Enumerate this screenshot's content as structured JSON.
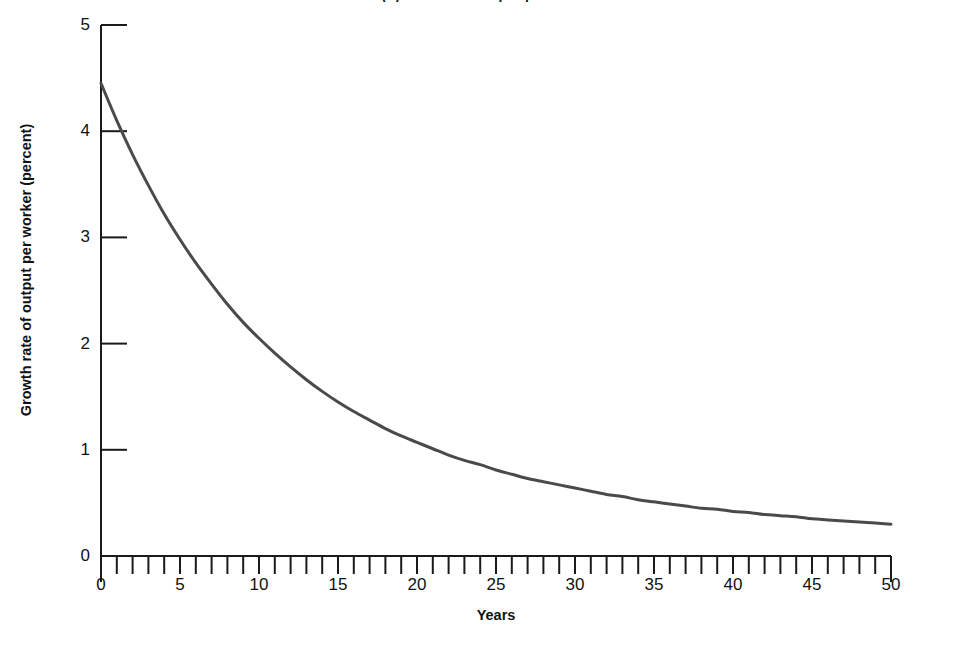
{
  "chart_data": {
    "type": "line",
    "title": "(b) Growth of output per worker",
    "xlabel": "Years",
    "ylabel": "Growth rate of output per worker (percent)",
    "xlim": [
      0,
      50
    ],
    "ylim": [
      0,
      5
    ],
    "xticks": [
      0,
      5,
      10,
      15,
      20,
      25,
      30,
      35,
      40,
      45,
      50
    ],
    "xtick_labels": [
      "0",
      "5",
      "10",
      "15",
      "20",
      "25",
      "30",
      "35",
      "40",
      "45",
      "50"
    ],
    "xminor_tick_step": 1,
    "yticks": [
      0,
      1,
      2,
      3,
      4,
      5
    ],
    "ytick_labels": [
      "0",
      "1",
      "2",
      "3",
      "4",
      "5"
    ],
    "grid": false,
    "legend": false,
    "series": [
      {
        "name": "Growth rate of output per worker",
        "color": "#4a4a4a",
        "line_width": 3,
        "x": [
          0,
          1,
          2,
          3,
          4,
          5,
          6,
          7,
          8,
          9,
          10,
          11,
          12,
          13,
          14,
          15,
          16,
          17,
          18,
          19,
          20,
          21,
          22,
          23,
          24,
          25,
          26,
          27,
          28,
          29,
          30,
          31,
          32,
          33,
          34,
          35,
          36,
          37,
          38,
          39,
          40,
          41,
          42,
          43,
          44,
          45,
          46,
          47,
          48,
          49,
          50
        ],
        "values": [
          4.45,
          4.1,
          3.78,
          3.49,
          3.22,
          2.98,
          2.76,
          2.56,
          2.37,
          2.2,
          2.05,
          1.91,
          1.78,
          1.66,
          1.55,
          1.45,
          1.36,
          1.28,
          1.2,
          1.13,
          1.07,
          1.01,
          0.95,
          0.9,
          0.86,
          0.81,
          0.77,
          0.73,
          0.7,
          0.67,
          0.64,
          0.61,
          0.58,
          0.56,
          0.53,
          0.51,
          0.49,
          0.47,
          0.45,
          0.44,
          0.42,
          0.41,
          0.39,
          0.38,
          0.37,
          0.35,
          0.34,
          0.33,
          0.32,
          0.31,
          0.3
        ]
      }
    ],
    "axis_color": "#1a1a1a",
    "background": "#ffffff"
  }
}
